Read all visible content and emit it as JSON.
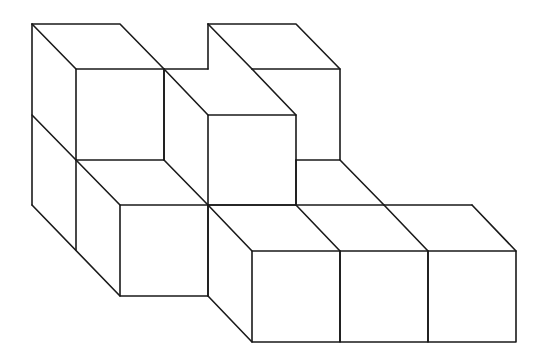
{
  "diagram": {
    "title": "",
    "stroke_color": "#1a1a1a",
    "background": "#ffffff",
    "cube_count_visible_front_faces": 6,
    "cube_size_px": 88,
    "depth_offset_px": [
      44,
      45
    ]
  }
}
